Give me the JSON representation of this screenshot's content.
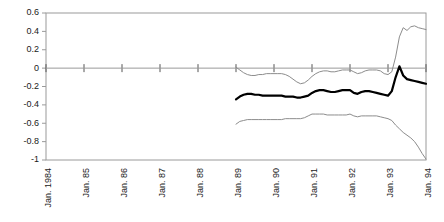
{
  "chart_data": {
    "type": "line",
    "title": "",
    "subtitle": "",
    "xlabel": "",
    "ylabel": "",
    "grid": false,
    "legend_position": "none",
    "xlim": [
      0,
      10
    ],
    "ylim": [
      -1,
      0.6
    ],
    "y_ticks": [
      0.6,
      0.4,
      0.2,
      0,
      -0.2,
      -0.4,
      -0.6,
      -0.8,
      -1
    ],
    "y_tick_labels": [
      "0.6",
      "0.4",
      "0.2",
      "0",
      "-0.2",
      "-0.4",
      "-0.6",
      "-0.8",
      "-1"
    ],
    "x_ticks": [
      0,
      1,
      2,
      3,
      4,
      5,
      6,
      7,
      8,
      9,
      10
    ],
    "categories": [
      "Jan. 1984",
      "Jan. 85",
      "Jan. 86",
      "Jan. 87",
      "Jan. 88",
      "Jan. 89",
      "Jan. 90",
      "Jan. 91",
      "Jan. 92",
      "Jan. 93",
      "Jan. 94"
    ],
    "zero_line": 0,
    "series": [
      {
        "name": "upper-band",
        "color": "#8c8c8c",
        "style": "thin",
        "x": [
          5.0,
          5.1,
          5.2,
          5.3,
          5.4,
          5.5,
          5.6,
          5.7,
          5.8,
          5.9,
          6.0,
          6.1,
          6.2,
          6.3,
          6.4,
          6.5,
          6.6,
          6.7,
          6.8,
          6.9,
          7.0,
          7.1,
          7.2,
          7.3,
          7.4,
          7.5,
          7.6,
          7.7,
          7.8,
          7.9,
          8.0,
          8.1,
          8.2,
          8.3,
          8.4,
          8.5,
          8.6,
          8.7,
          8.8,
          8.9,
          9.0,
          9.1,
          9.2,
          9.3,
          9.4,
          9.5,
          9.6,
          9.7,
          9.8,
          9.9,
          10.0
        ],
        "values": [
          0.01,
          -0.02,
          -0.05,
          -0.07,
          -0.08,
          -0.08,
          -0.07,
          -0.07,
          -0.06,
          -0.06,
          -0.06,
          -0.06,
          -0.06,
          -0.07,
          -0.09,
          -0.12,
          -0.15,
          -0.17,
          -0.16,
          -0.13,
          -0.09,
          -0.06,
          -0.04,
          -0.03,
          -0.03,
          -0.04,
          -0.04,
          -0.03,
          -0.02,
          -0.02,
          -0.02,
          -0.04,
          -0.06,
          -0.05,
          -0.03,
          -0.02,
          -0.02,
          -0.02,
          -0.03,
          -0.06,
          -0.07,
          -0.04,
          0.12,
          0.34,
          0.44,
          0.41,
          0.45,
          0.46,
          0.44,
          0.43,
          0.42
        ]
      },
      {
        "name": "center-estimate",
        "color": "#000000",
        "style": "bold",
        "x": [
          5.0,
          5.1,
          5.2,
          5.3,
          5.4,
          5.5,
          5.6,
          5.7,
          5.8,
          5.9,
          6.0,
          6.1,
          6.2,
          6.3,
          6.4,
          6.5,
          6.6,
          6.7,
          6.8,
          6.9,
          7.0,
          7.1,
          7.2,
          7.3,
          7.4,
          7.5,
          7.6,
          7.7,
          7.8,
          7.9,
          8.0,
          8.1,
          8.2,
          8.3,
          8.4,
          8.5,
          8.6,
          8.7,
          8.8,
          8.9,
          9.0,
          9.1,
          9.2,
          9.3,
          9.4,
          9.5,
          9.6,
          9.7,
          9.8,
          9.9,
          10.0
        ],
        "values": [
          -0.34,
          -0.31,
          -0.29,
          -0.28,
          -0.28,
          -0.29,
          -0.29,
          -0.3,
          -0.3,
          -0.3,
          -0.3,
          -0.3,
          -0.3,
          -0.31,
          -0.31,
          -0.31,
          -0.32,
          -0.32,
          -0.31,
          -0.3,
          -0.27,
          -0.25,
          -0.24,
          -0.24,
          -0.25,
          -0.26,
          -0.26,
          -0.25,
          -0.24,
          -0.24,
          -0.24,
          -0.27,
          -0.28,
          -0.26,
          -0.25,
          -0.25,
          -0.26,
          -0.27,
          -0.28,
          -0.29,
          -0.3,
          -0.25,
          -0.1,
          0.02,
          -0.08,
          -0.12,
          -0.13,
          -0.14,
          -0.15,
          -0.16,
          -0.17
        ]
      },
      {
        "name": "lower-band",
        "color": "#8c8c8c",
        "style": "thin",
        "x": [
          5.0,
          5.1,
          5.2,
          5.3,
          5.4,
          5.5,
          5.6,
          5.7,
          5.8,
          5.9,
          6.0,
          6.1,
          6.2,
          6.3,
          6.4,
          6.5,
          6.6,
          6.7,
          6.8,
          6.9,
          7.0,
          7.1,
          7.2,
          7.3,
          7.4,
          7.5,
          7.6,
          7.7,
          7.8,
          7.9,
          8.0,
          8.1,
          8.2,
          8.3,
          8.4,
          8.5,
          8.6,
          8.7,
          8.8,
          8.9,
          9.0,
          9.1,
          9.2,
          9.3,
          9.4,
          9.5,
          9.6,
          9.7,
          9.8,
          9.9,
          10.0
        ],
        "values": [
          -0.61,
          -0.58,
          -0.57,
          -0.56,
          -0.56,
          -0.56,
          -0.56,
          -0.56,
          -0.56,
          -0.56,
          -0.56,
          -0.56,
          -0.56,
          -0.55,
          -0.55,
          -0.55,
          -0.55,
          -0.55,
          -0.54,
          -0.52,
          -0.5,
          -0.5,
          -0.5,
          -0.5,
          -0.51,
          -0.51,
          -0.51,
          -0.51,
          -0.51,
          -0.51,
          -0.5,
          -0.52,
          -0.53,
          -0.52,
          -0.52,
          -0.52,
          -0.52,
          -0.52,
          -0.53,
          -0.54,
          -0.55,
          -0.57,
          -0.62,
          -0.66,
          -0.7,
          -0.73,
          -0.76,
          -0.8,
          -0.86,
          -0.93,
          -0.99
        ]
      }
    ]
  },
  "axes": {
    "plot_left": 46,
    "plot_right": 426,
    "plot_top": 13,
    "plot_bottom": 160
  },
  "colors": {
    "band": "#8c8c8c",
    "center": "#000000",
    "frame": "#9a9a9a",
    "axis_text": "#1a1a1a"
  }
}
